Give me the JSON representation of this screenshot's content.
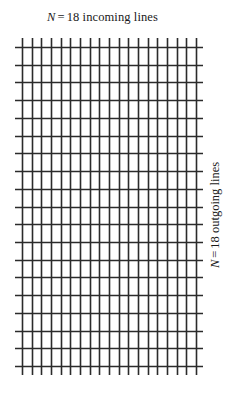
{
  "figure": {
    "type": "crossbar-switch-grid",
    "background_color": "#ffffff",
    "line_color": "#2b2b2b"
  },
  "labels": {
    "top": {
      "symbol": "N",
      "equals": "=",
      "text": "18 incoming lines",
      "full": "N = 18 incoming lines"
    },
    "right": {
      "symbol": "N",
      "equals": "=",
      "text": "18 outgoing lines",
      "full": "N = 18 outgoing lines",
      "rotation_degrees": -90
    }
  },
  "chart_data": {
    "type": "diagram",
    "title": "",
    "incoming_lines": 18,
    "outgoing_lines": 18,
    "vertical_line_count": 19,
    "horizontal_line_count": 19,
    "grid": {
      "x_start": 22,
      "x_end": 196,
      "y_start": 47,
      "y_end": 366,
      "vertical_spacing": 9.667,
      "horizontal_spacing": 17.722,
      "vertical_overshoot_top": 9,
      "vertical_overshoot_bottom": 9,
      "horizontal_overshoot_left": 7,
      "horizontal_overshoot_right": 7,
      "stroke_width": 1.6
    }
  }
}
